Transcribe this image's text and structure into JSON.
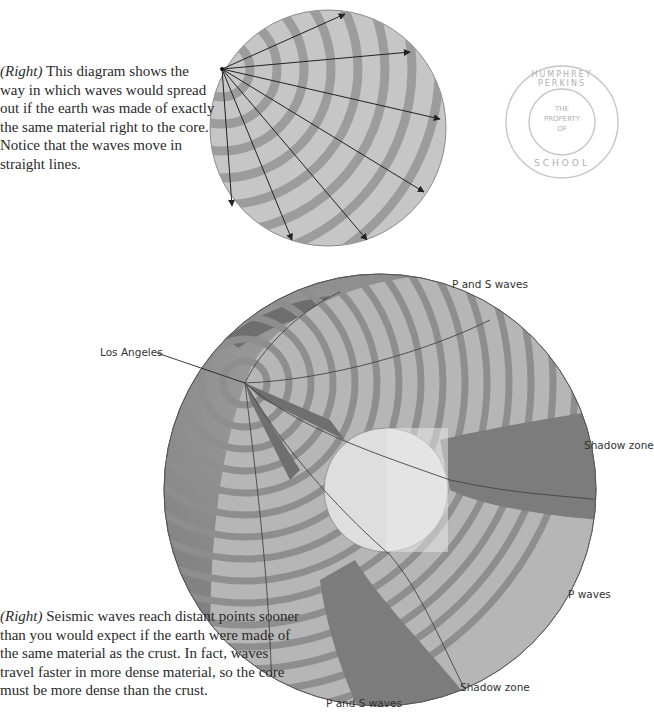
{
  "captions": {
    "top": {
      "lead": "(Right)",
      "text": " This diagram shows the way in which waves would spread out if the earth was made of exactly the same material right to the core. Notice that the waves move in straight lines."
    },
    "bottom": {
      "lead": "(Right)",
      "text": " Seismic waves reach distant points sooner than you would expect if the earth were made of the same material as the crust. In fact, waves travel faster in more dense material, so the core must be more dense than the crust."
    }
  },
  "stamp": {
    "ring_text_top": "HUMPHREY PERKINS",
    "ring_text_bottom": "SCHOOL",
    "center_lines": [
      "THE",
      "PROPERTY",
      "OF"
    ]
  },
  "labels": {
    "p_and_s_top": "P and S waves",
    "los_angeles": "Los Angeles",
    "shadow_zone_right": "Shadow zone",
    "p_waves": "P waves",
    "shadow_zone_bottom": "Shadow zone",
    "p_and_s_bottom": "P and S waves"
  },
  "colors": {
    "background": "#ffffff",
    "band_light": "#c4c4c4",
    "band_dark": "#9a9a9a",
    "globe_surface": "#8a8a8a",
    "shadow_zone": "#7d7d7d",
    "core": "#e2e2e2",
    "text": "#2a2a2a"
  }
}
